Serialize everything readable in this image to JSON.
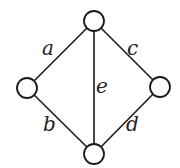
{
  "diagram": {
    "type": "graph",
    "colors": {
      "stroke": "#1a1a1a",
      "node_fill": "#ffffff",
      "label": "#222222",
      "background": "#ffffff"
    },
    "node_radius": 10,
    "nodes": [
      {
        "id": "top",
        "x": 94,
        "y": 21
      },
      {
        "id": "left",
        "x": 27,
        "y": 88
      },
      {
        "id": "right",
        "x": 160,
        "y": 87
      },
      {
        "id": "bottom",
        "x": 94,
        "y": 154
      }
    ],
    "edges": [
      {
        "label": "a",
        "from": "top",
        "to": "left",
        "label_x": 42,
        "label_y": 55
      },
      {
        "label": "b",
        "from": "left",
        "to": "bottom",
        "label_x": 43,
        "label_y": 131
      },
      {
        "label": "c",
        "from": "top",
        "to": "right",
        "label_x": 127,
        "label_y": 55
      },
      {
        "label": "d",
        "from": "right",
        "to": "bottom",
        "label_x": 126,
        "label_y": 131
      },
      {
        "label": "e",
        "from": "top",
        "to": "bottom",
        "label_x": 96,
        "label_y": 93
      }
    ]
  }
}
